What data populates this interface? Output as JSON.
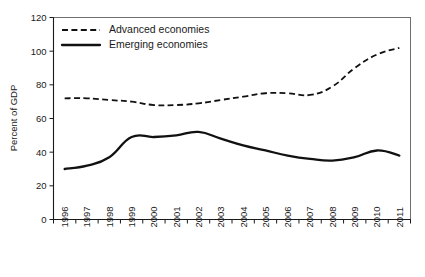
{
  "chart_data": {
    "type": "line",
    "title": "",
    "subtitle": "",
    "xlabel": "",
    "ylabel": "Percent of GDP",
    "ylim": [
      0,
      120
    ],
    "yticks": [
      0,
      20,
      40,
      60,
      80,
      100,
      120
    ],
    "ytick_labels": [
      "0",
      "20",
      "40",
      "60",
      "80",
      "100",
      "120"
    ],
    "grid": false,
    "legend_position": "top-left-inside",
    "categories": [
      "1996",
      "1997",
      "1998",
      "1999",
      "2000",
      "2001",
      "2002",
      "2003",
      "2004",
      "2005",
      "2006",
      "2007",
      "2008",
      "2009",
      "2010",
      "2011"
    ],
    "x": [
      1996,
      1997,
      1998,
      1999,
      2000,
      2001,
      2002,
      2003,
      2004,
      2005,
      2006,
      2007,
      2008,
      2009,
      2010,
      2011
    ],
    "series": [
      {
        "name": "Advanced economies",
        "style": "dashed",
        "color": "#111111",
        "values": [
          72,
          72,
          71,
          70,
          68,
          68,
          69,
          71,
          73,
          75,
          75,
          74,
          79,
          90,
          98,
          102
        ]
      },
      {
        "name": "Emerging economies",
        "style": "solid",
        "color": "#111111",
        "values": [
          30,
          32,
          37,
          49,
          49,
          50,
          52,
          48,
          44,
          41,
          38,
          36,
          35,
          37,
          41,
          38
        ]
      }
    ],
    "legend": [
      {
        "label": "Advanced economies",
        "style": "dashed"
      },
      {
        "label": "Emerging economies",
        "style": "solid"
      }
    ]
  },
  "axes": {
    "y_axis_title": "Percent of GDP"
  }
}
